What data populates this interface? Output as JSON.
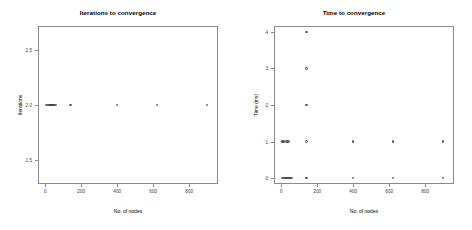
{
  "chart_data": [
    {
      "type": "scatter",
      "title": "Iterations to convergence",
      "xlabel": "No. of nodes",
      "ylabel": "Iterations",
      "xlim": [
        -40,
        960
      ],
      "ylim": [
        1.28,
        2.72
      ],
      "xticks": [
        0,
        200,
        400,
        600,
        800
      ],
      "xticklabels": [
        "0",
        "200",
        "400",
        "600",
        "800"
      ],
      "yticks": [
        1.5,
        2.0,
        2.5
      ],
      "yticklabels": [
        "1.5",
        "2.0",
        "2.5"
      ],
      "grid": false,
      "legend": "none",
      "marker": "open-circle",
      "x": [
        5,
        10,
        15,
        20,
        25,
        30,
        35,
        40,
        45,
        50,
        55,
        60,
        140,
        400,
        620,
        900
      ],
      "y": [
        2,
        2,
        2,
        2,
        2,
        2,
        2,
        2,
        2,
        2,
        2,
        2,
        2,
        2,
        2,
        2
      ]
    },
    {
      "type": "scatter",
      "title": "Time to convergence",
      "xlabel": "No. of nodes",
      "ylabel": "Time (ms)",
      "xlim": [
        -40,
        960
      ],
      "ylim": [
        -0.16,
        4.16
      ],
      "xticks": [
        0,
        200,
        400,
        600,
        800
      ],
      "xticklabels": [
        "0",
        "200",
        "400",
        "600",
        "800"
      ],
      "yticks": [
        0,
        1,
        2,
        3,
        4
      ],
      "yticklabels": [
        "0",
        "1",
        "2",
        "3",
        "4"
      ],
      "grid": false,
      "legend": "none",
      "marker": "open-circle",
      "x": [
        5,
        10,
        15,
        20,
        25,
        30,
        35,
        40,
        45,
        50,
        55,
        60,
        140,
        400,
        620,
        900,
        5,
        10,
        15,
        30,
        35,
        40,
        140,
        400,
        620,
        900,
        140,
        140,
        140
      ],
      "y": [
        0,
        0,
        0,
        0,
        0,
        0,
        0,
        0,
        0,
        0,
        0,
        0,
        0,
        0,
        0,
        0,
        1,
        1,
        1,
        1,
        1,
        1,
        1,
        1,
        1,
        1,
        2,
        3,
        4
      ]
    }
  ]
}
